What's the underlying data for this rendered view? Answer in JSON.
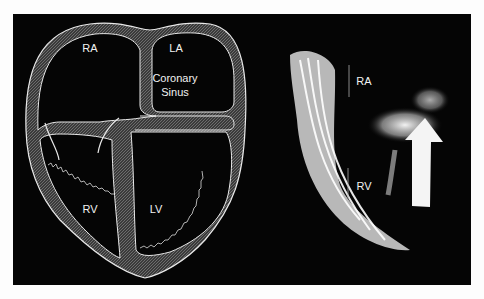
{
  "figure": {
    "background": "#050505",
    "page_background": "#fdfdfd",
    "left_panel": {
      "type": "schematic-diagram",
      "labels": {
        "ra": "RA",
        "la": "LA",
        "coronary_sinus_line1": "Coronary",
        "coronary_sinus_line2": "Sinus",
        "rv": "RV",
        "lv": "LV"
      }
    },
    "right_panel": {
      "type": "echocardiogram-image",
      "labels": {
        "ra": "RA",
        "rv": "RV"
      },
      "annotation": "arrow-pointing-up"
    }
  }
}
